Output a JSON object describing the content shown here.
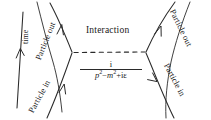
{
  "diagram": {
    "type": "feynman-diagram",
    "title_text": "",
    "axis": {
      "name": "time-axis",
      "label": "time",
      "direction": "upward",
      "arrow": "up-arrow-icon"
    },
    "labels": {
      "interaction": "Interaction",
      "particle_out_left": "Particle out",
      "particle_in_left": "Particle in",
      "particle_out_right": "Particle out",
      "particle_in_right": "Particle in"
    },
    "propagator": {
      "numerator": "i",
      "denominator_p": "p",
      "denominator_p_exp": "2",
      "denominator_minus": "−",
      "denominator_m": "m",
      "denominator_m_exp": "2",
      "denominator_tail": "+iε",
      "denominator_full": "p²−m²+iε",
      "full_text": "i / (p²−m²+iε)"
    },
    "colors": {
      "ink": "#1a1a1a",
      "line": "#2a2a2a",
      "background": "#ffffff"
    },
    "elements": {
      "left_vertex": "left-vertex",
      "right_vertex": "right-vertex",
      "propagator_line": "dashed-propagator-line",
      "incoming_left": "incoming-particle-line-left",
      "outgoing_left": "outgoing-particle-line-left",
      "incoming_right": "incoming-particle-line-right",
      "outgoing_right": "outgoing-particle-line-right"
    }
  }
}
